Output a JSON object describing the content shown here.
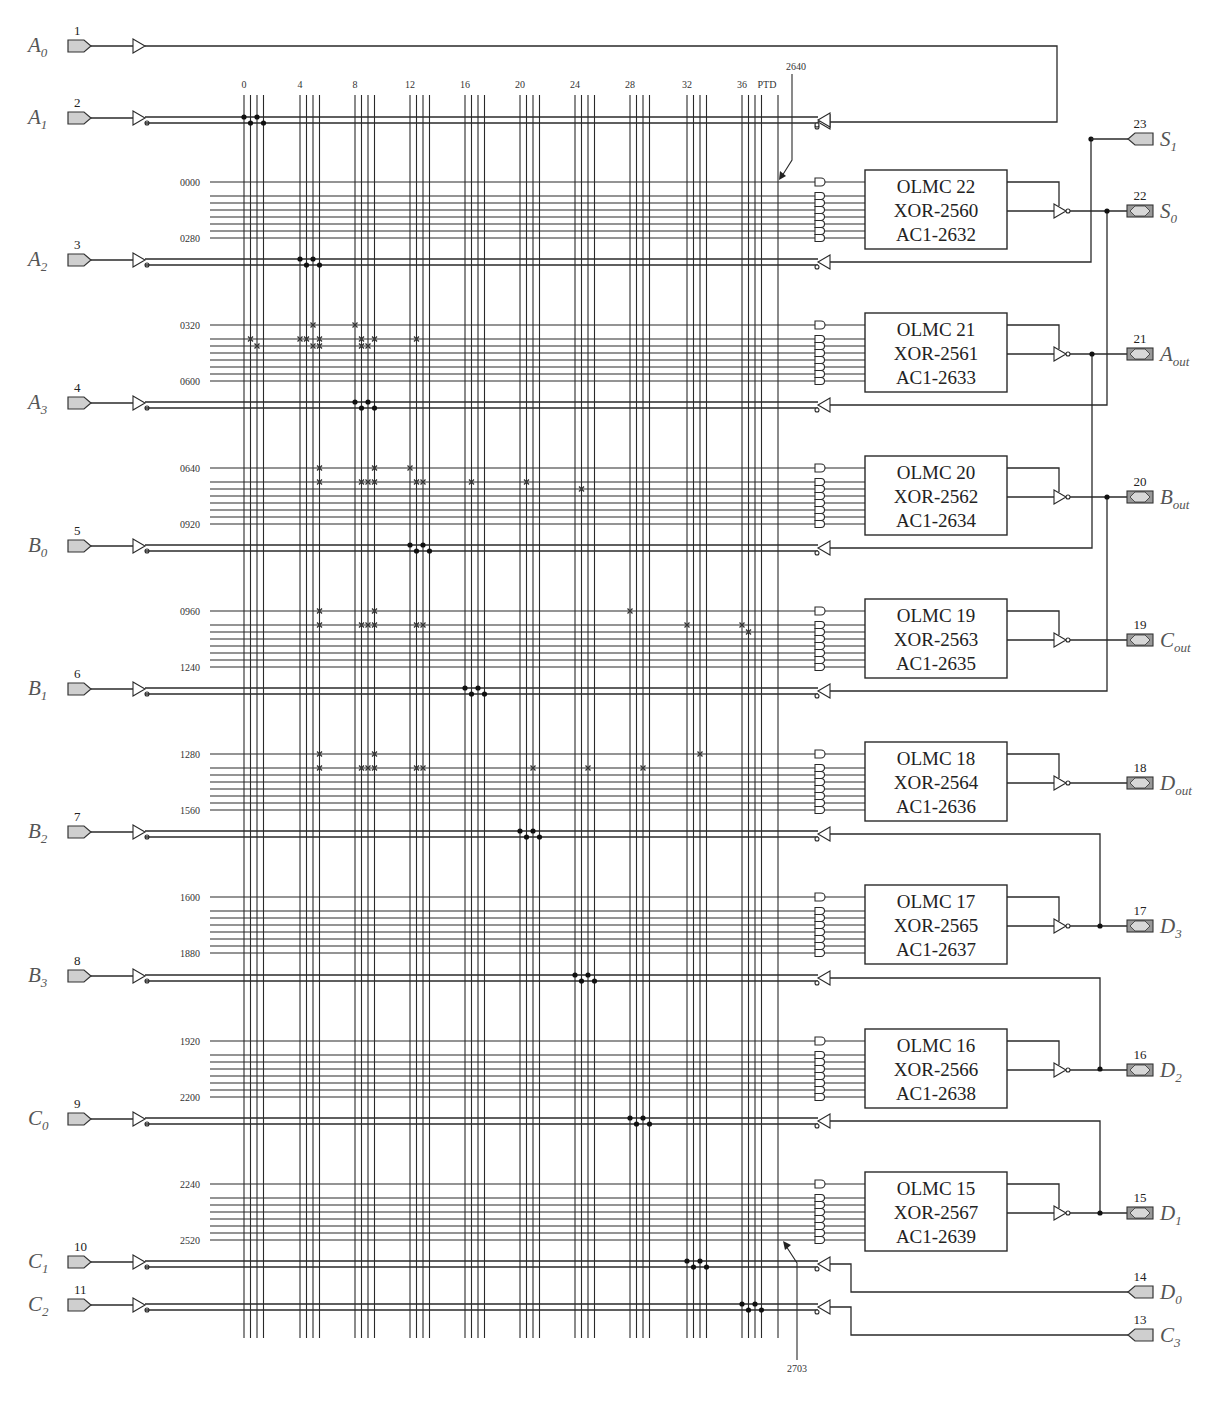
{
  "colors": {
    "wire": "#2a2a2a",
    "pin_fill": "#cfcfcf",
    "label": "#555555"
  },
  "column_header": {
    "group_labels": [
      "0",
      "4",
      "8",
      "12",
      "16",
      "20",
      "24",
      "28",
      "32",
      "36"
    ],
    "group_x": [
      244,
      300,
      355,
      410,
      465,
      520,
      575,
      630,
      687,
      742
    ],
    "ptd_label": "PTD",
    "ptd_x": 778,
    "arrow_top_label": "2640",
    "arrow_bottom_label": "2703"
  },
  "input_pins": [
    {
      "num": "1",
      "name": "A",
      "sub": "0",
      "y": 46,
      "direct": true
    },
    {
      "num": "2",
      "name": "A",
      "sub": "1",
      "y": 118,
      "fuse_group": 0
    },
    {
      "num": "3",
      "name": "A",
      "sub": "2",
      "y": 260,
      "fuse_group": 1
    },
    {
      "num": "4",
      "name": "A",
      "sub": "3",
      "y": 403,
      "fuse_group": 2
    },
    {
      "num": "5",
      "name": "B",
      "sub": "0",
      "y": 546,
      "fuse_group": 3
    },
    {
      "num": "6",
      "name": "B",
      "sub": "1",
      "y": 689,
      "fuse_group": 4
    },
    {
      "num": "7",
      "name": "B",
      "sub": "2",
      "y": 832,
      "fuse_group": 5
    },
    {
      "num": "8",
      "name": "B",
      "sub": "3",
      "y": 976,
      "fuse_group": 6
    },
    {
      "num": "9",
      "name": "C",
      "sub": "0",
      "y": 1119,
      "fuse_group": 7
    },
    {
      "num": "10",
      "name": "C",
      "sub": "1",
      "y": 1262,
      "fuse_group": 8
    },
    {
      "num": "11",
      "name": "C",
      "sub": "2",
      "y": 1305,
      "fuse_group": 9
    }
  ],
  "product_blocks": [
    {
      "first": "0000",
      "last": "0280",
      "y0": 182,
      "olmc": "OLMC 22",
      "xor": "XOR-2560",
      "ac1": "AC1-2632",
      "pin_num": "22",
      "pin_name": "S",
      "pin_sub": "0",
      "fuses": []
    },
    {
      "first": "0320",
      "last": "0600",
      "y0": 325,
      "olmc": "OLMC 21",
      "xor": "XOR-2561",
      "ac1": "AC1-2633",
      "pin_num": "21",
      "pin_name": "A",
      "pin_sub": "out",
      "fuses": [
        [
          0,
          1,
          2
        ],
        [
          1,
          1,
          3
        ],
        [
          1,
          2,
          3
        ],
        [
          0,
          2,
          0
        ],
        [
          1,
          1,
          0
        ],
        [
          1,
          0,
          1
        ],
        [
          1,
          1,
          1
        ],
        [
          1,
          2,
          1
        ],
        [
          1,
          3,
          1
        ],
        [
          2,
          1,
          3
        ],
        [
          2,
          2,
          1
        ],
        [
          2,
          1,
          2
        ],
        [
          2,
          2,
          2
        ],
        [
          2,
          0,
          2
        ]
      ]
    },
    {
      "first": "0640",
      "last": "0920",
      "y0": 468,
      "olmc": "OLMC 20",
      "xor": "XOR-2562",
      "ac1": "AC1-2634",
      "pin_num": "20",
      "pin_name": "B",
      "pin_sub": "out",
      "fuses": [
        [
          0,
          1,
          3
        ],
        [
          1,
          1,
          3
        ],
        [
          1,
          2,
          2
        ],
        [
          1,
          3,
          2
        ],
        [
          0,
          2,
          3
        ],
        [
          1,
          2,
          1
        ],
        [
          1,
          3,
          1
        ],
        [
          1,
          2,
          3
        ],
        [
          0,
          3,
          0
        ],
        [
          1,
          4,
          1
        ],
        [
          1,
          5,
          1
        ],
        [
          2,
          6,
          1
        ]
      ]
    },
    {
      "first": "0960",
      "last": "1240",
      "y0": 611,
      "olmc": "OLMC 19",
      "xor": "XOR-2563",
      "ac1": "AC1-2635",
      "pin_num": "19",
      "pin_name": "C",
      "pin_sub": "out",
      "fuses": [
        [
          0,
          1,
          3
        ],
        [
          1,
          1,
          3
        ],
        [
          1,
          2,
          2
        ],
        [
          1,
          3,
          2
        ],
        [
          0,
          2,
          3
        ],
        [
          1,
          2,
          1
        ],
        [
          1,
          3,
          1
        ],
        [
          1,
          2,
          3
        ],
        [
          0,
          7,
          0
        ],
        [
          1,
          8,
          0
        ],
        [
          1,
          9,
          0
        ],
        [
          2,
          9,
          1
        ]
      ]
    },
    {
      "first": "1280",
      "last": "1560",
      "y0": 754,
      "olmc": "OLMC 18",
      "xor": "XOR-2564",
      "ac1": "AC1-2636",
      "pin_num": "18",
      "pin_name": "D",
      "pin_sub": "out",
      "fuses": [
        [
          0,
          1,
          3
        ],
        [
          1,
          1,
          3
        ],
        [
          1,
          2,
          2
        ],
        [
          1,
          3,
          2
        ],
        [
          0,
          2,
          3
        ],
        [
          1,
          2,
          1
        ],
        [
          1,
          3,
          1
        ],
        [
          1,
          2,
          3
        ],
        [
          1,
          5,
          2
        ],
        [
          1,
          6,
          2
        ],
        [
          1,
          7,
          2
        ],
        [
          0,
          8,
          2
        ]
      ]
    },
    {
      "first": "1600",
      "last": "1880",
      "y0": 897,
      "olmc": "OLMC 17",
      "xor": "XOR-2565",
      "ac1": "AC1-2637",
      "pin_num": "17",
      "pin_name": "D",
      "pin_sub": "3",
      "fuses": []
    },
    {
      "first": "1920",
      "last": "2200",
      "y0": 1041,
      "olmc": "OLMC 16",
      "xor": "XOR-2566",
      "ac1": "AC1-2638",
      "pin_num": "16",
      "pin_name": "D",
      "pin_sub": "2",
      "fuses": []
    },
    {
      "first": "2240",
      "last": "2520",
      "y0": 1184,
      "olmc": "OLMC 15",
      "xor": "XOR-2567",
      "ac1": "AC1-2639",
      "pin_num": "15",
      "pin_name": "D",
      "pin_sub": "1",
      "fuses": []
    }
  ],
  "right_input_pins": [
    {
      "num": "23",
      "name": "S",
      "sub": "1",
      "y": 139
    },
    {
      "num": "14",
      "name": "D",
      "sub": "0",
      "y": 1292
    },
    {
      "num": "13",
      "name": "C",
      "sub": "3",
      "y": 1335
    }
  ],
  "feedback_routes": [
    {
      "from_y": 46,
      "to_y": 118,
      "x": 1057,
      "note": "A0 loop"
    },
    {
      "from_y": 139,
      "to_y": 260,
      "x": 1091
    },
    {
      "from_y": 211,
      "to_y": 403,
      "x": 1107
    },
    {
      "from_y": 354,
      "to_y": 546,
      "x": 1092
    },
    {
      "from_y": 497,
      "to_y": 689,
      "x": 1107
    },
    {
      "from_y": 926,
      "to_y": 832,
      "x": 1100
    },
    {
      "from_y": 1069,
      "to_y": 976,
      "x": 1100
    },
    {
      "from_y": 1213,
      "to_y": 1119,
      "x": 1100
    }
  ]
}
